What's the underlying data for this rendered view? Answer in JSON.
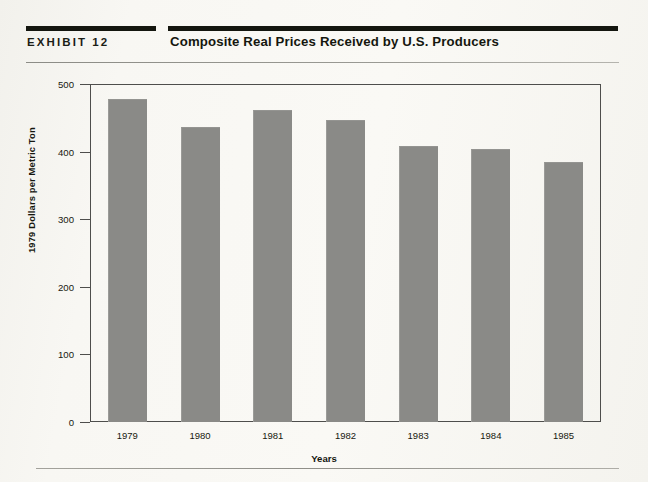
{
  "header": {
    "exhibit_label": "EXHIBIT 12",
    "title": "Composite Real Prices Received by U.S. Producers"
  },
  "chart_data": {
    "type": "bar",
    "title": "Composite Real Prices Received by U.S. Producers",
    "xlabel": "Years",
    "ylabel": "1979 Dollars per Metric Ton",
    "categories": [
      "1979",
      "1980",
      "1981",
      "1982",
      "1983",
      "1984",
      "1985"
    ],
    "values": [
      478,
      436,
      462,
      447,
      409,
      404,
      384
    ],
    "ylim": [
      0,
      500
    ],
    "yticks": [
      0,
      100,
      200,
      300,
      400,
      500
    ],
    "ytick_labels": [
      "0",
      "100",
      "200",
      "300",
      "400",
      "500"
    ],
    "grid": false,
    "legend": null,
    "bar_color": "#8a8a87"
  },
  "colors": {
    "rule": "#14160f",
    "axis": "#4e4e4c",
    "bar": "#8a8a87",
    "paper": "#f6f5f0",
    "text": "#16170f"
  }
}
